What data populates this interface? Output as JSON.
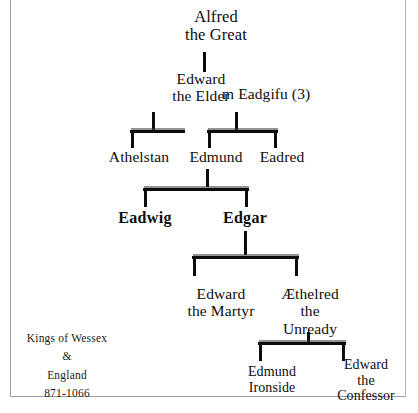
{
  "diagram": {
    "kind": "family-tree",
    "title_caption": "Kings of Wessex\n&\nEngland\n871-1066",
    "caption_lines": [
      "Kings of Wessex",
      "&",
      "England",
      "871-1066"
    ],
    "date_range": "871-1066",
    "generations": [
      {
        "level": 1,
        "people": [
          {
            "id": "alfred",
            "label": "Alfred\nthe Great",
            "bold": false
          }
        ]
      },
      {
        "level": 2,
        "people": [
          {
            "id": "edward-elder",
            "label": "Edward\nthe Elder",
            "bold": false
          },
          {
            "id": "eadgifu",
            "label": "m Eadgifu (3)",
            "bold": false,
            "role": "spouse"
          }
        ]
      },
      {
        "level": 3,
        "people": [
          {
            "id": "athelstan",
            "label": "Athelstan",
            "bold": false
          },
          {
            "id": "edmund",
            "label": "Edmund",
            "bold": false
          },
          {
            "id": "eadred",
            "label": "Eadred",
            "bold": false
          }
        ]
      },
      {
        "level": 4,
        "people": [
          {
            "id": "eadwig",
            "label": "Eadwig",
            "bold": true
          },
          {
            "id": "edgar",
            "label": "Edgar",
            "bold": true
          }
        ]
      },
      {
        "level": 5,
        "people": [
          {
            "id": "edward-martyr",
            "label": "Edward\nthe Martyr",
            "bold": false
          },
          {
            "id": "aethelred",
            "label": "Æthelred\nthe\nUnready",
            "bold": false
          }
        ]
      },
      {
        "level": 6,
        "people": [
          {
            "id": "edmund-ironside",
            "label": "Edmund\nIronside",
            "bold": false
          },
          {
            "id": "edward-confessor",
            "label": "Edward\nthe\nConfessor",
            "bold": false
          }
        ]
      }
    ],
    "colors": {
      "ink": "#0b0b0b",
      "background": "#ffffff",
      "frame": "#9d9d9d"
    }
  }
}
